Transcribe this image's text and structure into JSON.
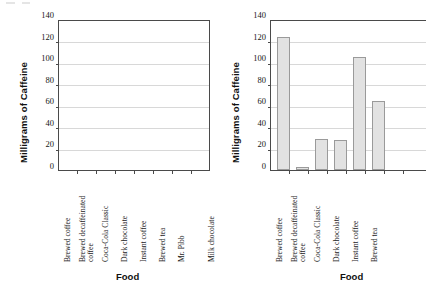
{
  "chart_data": [
    {
      "id": "left",
      "type": "bar",
      "title": "",
      "xlabel": "Food",
      "ylabel": "Milligrams of Caffeine",
      "ylim": [
        0,
        140
      ],
      "yticks": [
        0,
        20,
        40,
        60,
        80,
        100,
        120,
        140
      ],
      "grid": true,
      "legend": "none",
      "categories": [
        "Brewed coffee",
        "Brewed decaffeinated coffee",
        "Coca-Cola Classic",
        "Dark chocolate",
        "Instant coffee",
        "Brewed tea",
        "Mr. Pibb",
        "Milk chocolate"
      ],
      "values": [
        null,
        null,
        null,
        null,
        null,
        null,
        null,
        null
      ],
      "note": "empty plot area - no bars drawn"
    },
    {
      "id": "right",
      "type": "bar",
      "title": "",
      "xlabel": "Food",
      "ylabel": "Milligrams of Caffeine",
      "ylim": [
        0,
        140
      ],
      "yticks": [
        0,
        20,
        40,
        60,
        80,
        100,
        120,
        140
      ],
      "grid": true,
      "legend": "none",
      "categories": [
        "Brewed coffee",
        "Brewed decaffeinated coffee",
        "Coca-Cola Classic",
        "Dark chocolate",
        "Instant coffee",
        "Brewed tea"
      ],
      "values": [
        123,
        3,
        29,
        28,
        105,
        64
      ],
      "bar_fill": "#e2e2e2",
      "bar_stroke": "#9a9a9a"
    }
  ],
  "panels": {
    "left": {
      "name": "empty-caffeine-chart",
      "ylabel": "Milligrams of Caffeine",
      "xlabel": "Food",
      "yticks": [
        "140",
        "120",
        "100",
        "80",
        "60",
        "40",
        "20",
        "0"
      ],
      "categories": [
        {
          "line1": "Brewed coffee",
          "line2": ""
        },
        {
          "line1": "Brewed decaffeinated",
          "line2": "coffee"
        },
        {
          "line1": "Coca-Cola Classic",
          "line2": ""
        },
        {
          "line1": "Dark chocolate",
          "line2": ""
        },
        {
          "line1": "Instant coffee",
          "line2": ""
        },
        {
          "line1": "Brewed tea",
          "line2": ""
        },
        {
          "line1": "Mr. Pibb",
          "line2": ""
        },
        {
          "line1": "Milk chocolate",
          "line2": ""
        }
      ]
    },
    "right": {
      "name": "filled-caffeine-chart",
      "ylabel": "Milligrams of Caffeine",
      "xlabel": "Food",
      "yticks": [
        "140",
        "120",
        "100",
        "80",
        "60",
        "40",
        "20",
        "0"
      ],
      "categories": [
        {
          "line1": "Brewed coffee",
          "line2": ""
        },
        {
          "line1": "Brewed decaffeinated",
          "line2": "coffee"
        },
        {
          "line1": "Coca-Cola Classic",
          "line2": ""
        },
        {
          "line1": "Dark chocolate",
          "line2": ""
        },
        {
          "line1": "Instant coffee",
          "line2": ""
        },
        {
          "line1": "Brewed tea",
          "line2": ""
        }
      ]
    }
  },
  "colors": {
    "bar_fill": "#e2e2e2",
    "bar_stroke": "#9a9a9a",
    "axis": "#4a4a4a",
    "grid": "#d8d8d8",
    "text": "#1a1a1a"
  }
}
